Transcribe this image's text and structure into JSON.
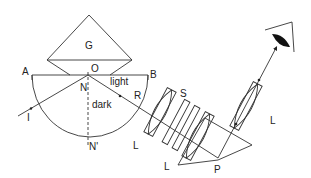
{
  "diagram": {
    "labels": {
      "prism_G": "G",
      "point_O": "O",
      "point_A": "A",
      "point_B": "B",
      "normal_N": "N",
      "normal_N_prime": "N'",
      "incident_I": "I",
      "refracted_R": "R",
      "region_light": "light",
      "region_dark": "dark",
      "lens_1": "L",
      "lens_2": "L",
      "lens_3": "L",
      "slit_S": "S",
      "prism_P": "P"
    },
    "icons": {
      "eye": "eye-icon"
    },
    "colors": {
      "line": "#333333",
      "background": "#ffffff"
    }
  }
}
